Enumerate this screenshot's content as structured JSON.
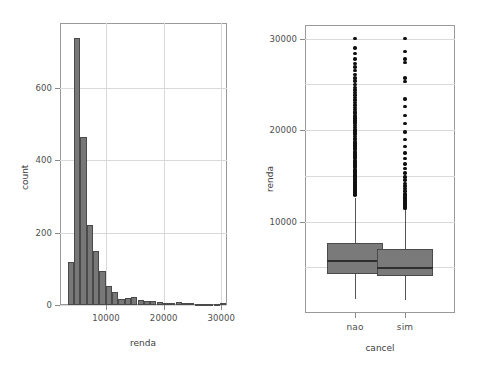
{
  "figure": {
    "background": "#ffffff",
    "bar_fill": "#777777",
    "bar_edge": "#4a4a4a",
    "box_fill": "#7a7a7a",
    "box_edge": "#4a4a4a",
    "median_color": "#2f2f2f",
    "outlier_color": "#111111",
    "grid_color": "#d9d9d9",
    "frame_color": "#9a9a9a",
    "caption_text": ""
  },
  "chart_data": [
    {
      "type": "bar",
      "name": "histogram-renda",
      "title": "",
      "xlabel": "renda",
      "ylabel": "count",
      "xlim": [
        2000,
        31000
      ],
      "ylim": [
        0,
        780
      ],
      "grid": true,
      "legend": "none",
      "xticks": [
        10000,
        20000,
        30000
      ],
      "xticklabels": [
        "10000",
        "20000",
        "30000"
      ],
      "yticks": [
        0,
        200,
        400,
        600
      ],
      "yticklabels": [
        "0",
        "200",
        "400",
        "600"
      ],
      "bin_width": 1100,
      "bin_starts": [
        3350,
        4450,
        5550,
        6650,
        7750,
        8850,
        9950,
        11050,
        12150,
        13250,
        14350,
        15450,
        16550,
        17650,
        18750,
        19850,
        20950,
        22050,
        23150,
        24250,
        25350,
        26450,
        27550,
        28650,
        29750
      ],
      "categories": [
        "3350",
        "4450",
        "5550",
        "6650",
        "7750",
        "8850",
        "9950",
        "11050",
        "12150",
        "13250",
        "14350",
        "15450",
        "16550",
        "17650",
        "18750",
        "19850",
        "20950",
        "22050",
        "23150",
        "24250",
        "25350",
        "26450",
        "27550",
        "28650",
        "29750"
      ],
      "values": [
        118,
        740,
        465,
        222,
        150,
        95,
        52,
        36,
        16,
        20,
        21,
        13,
        12,
        10,
        8,
        6,
        5,
        8,
        6,
        5,
        4,
        4,
        4,
        4,
        5
      ]
    },
    {
      "type": "boxplot",
      "name": "boxplot-renda-by-cancel",
      "title": "",
      "xlabel": "cancel",
      "ylabel": "renda",
      "ylim": [
        0,
        31500
      ],
      "grid": true,
      "legend": "none",
      "yticks": [
        10000,
        20000,
        30000
      ],
      "yticklabels": [
        "10000",
        "20000",
        "30000"
      ],
      "categories": [
        "nao",
        "sim"
      ],
      "boxes": [
        {
          "category": "nao",
          "whisker_low": 1500,
          "q1": 4300,
          "median": 5800,
          "q3": 7700,
          "whisker_high": 12600,
          "outliers": [
            12900,
            13000,
            13200,
            13300,
            13450,
            13600,
            13750,
            13900,
            14050,
            14200,
            14350,
            14500,
            14650,
            14800,
            14950,
            15100,
            15250,
            15400,
            15550,
            15700,
            15900,
            16050,
            16200,
            16400,
            16550,
            16700,
            16900,
            17050,
            17200,
            17400,
            17550,
            17700,
            17900,
            18050,
            18250,
            18400,
            18600,
            18750,
            18950,
            19100,
            19300,
            19500,
            19700,
            19900,
            20100,
            20300,
            20500,
            20700,
            20900,
            21100,
            21350,
            21550,
            21800,
            22000,
            22250,
            22500,
            22750,
            23000,
            23300,
            23550,
            23850,
            24100,
            24400,
            24700,
            25000,
            25400,
            25700,
            26100,
            26500,
            26900,
            27300,
            27800,
            28400,
            29000,
            30000
          ]
        },
        {
          "category": "sim",
          "whisker_low": 1400,
          "q1": 4000,
          "median": 5000,
          "q3": 7000,
          "whisker_high": 11300,
          "outliers": [
            11450,
            11600,
            11750,
            11900,
            12050,
            12200,
            12350,
            12500,
            12700,
            12900,
            13100,
            13350,
            13600,
            13900,
            14200,
            14550,
            14900,
            15300,
            15800,
            16300,
            16900,
            17500,
            18200,
            19000,
            19800,
            20700,
            21600,
            22600,
            23400,
            25300,
            25700,
            27400,
            27800,
            28600,
            30000
          ]
        }
      ]
    }
  ]
}
